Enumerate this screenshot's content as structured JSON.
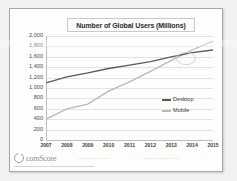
{
  "slide": {
    "background_color": "#f2f2f0",
    "card_background": "#fdfdfc",
    "border_color": "#a8a8a8"
  },
  "footer": {
    "logo_text": "comScore",
    "logo_mark_name": "comscore-circle-logo",
    "note_left": "——— ————— ——",
    "note_mid": "–",
    "note_right": "—— ——— ——— ———"
  },
  "chart_data": {
    "type": "line",
    "title": "Number of Global Users (Millions)",
    "xlabel": "",
    "ylabel": "",
    "categories": [
      "2007",
      "2008",
      "2009",
      "2010",
      "2011",
      "2012",
      "2013",
      "2014",
      "2015"
    ],
    "ylim": [
      0,
      2000
    ],
    "ytick_step": 200,
    "ytick_labels": [
      "2,000",
      "1,800",
      "1,600",
      "1,400",
      "1,200",
      "1,000",
      "800",
      "600",
      "400",
      "200",
      "0"
    ],
    "ytick_values": [
      2000,
      1800,
      1600,
      1400,
      1200,
      1000,
      800,
      600,
      400,
      200,
      0
    ],
    "grid": "horizontal",
    "legend_position": "right-inside",
    "series": [
      {
        "name": "Desktop",
        "color": "#5a5a5a",
        "values": [
          1100,
          1215,
          1290,
          1375,
          1440,
          1505,
          1600,
          1680,
          1730
        ]
      },
      {
        "name": "Mobile",
        "color": "#b9b9b9",
        "values": [
          400,
          600,
          690,
          940,
          1120,
          1320,
          1530,
          1730,
          1900
        ]
      }
    ],
    "annotations": [
      {
        "name": "crossover-highlight",
        "shape": "oval",
        "between_categories": [
          "2013",
          "2014"
        ],
        "approx_value": 1660
      }
    ]
  }
}
